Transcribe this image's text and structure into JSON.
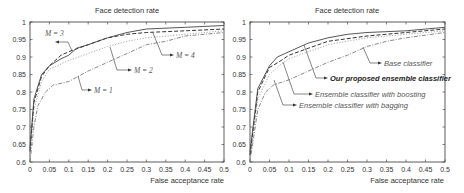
{
  "chart_data": [
    {
      "type": "line",
      "title": "Face detection rate",
      "xlabel": "False acceptance rate",
      "ylabel": "",
      "xlim": [
        0,
        0.5
      ],
      "ylim": [
        0.6,
        1.0
      ],
      "xticks": [
        "0",
        "0.05",
        "0.1",
        "0.15",
        "0.2",
        "0.25",
        "0.3",
        "0.35",
        "0.4",
        "0.45",
        "0.5"
      ],
      "yticks": [
        "0.6",
        "0.65",
        "0.7",
        "0.75",
        "0.8",
        "0.85",
        "0.9",
        "0.95",
        "1"
      ],
      "grid": false,
      "series": [
        {
          "name": "M = 1",
          "style": "dash-dot",
          "color": "#888888",
          "x": [
            0,
            0.01,
            0.02,
            0.04,
            0.06,
            0.1,
            0.15,
            0.2,
            0.25,
            0.3,
            0.35,
            0.4,
            0.45,
            0.5
          ],
          "y": [
            0.6,
            0.7,
            0.76,
            0.8,
            0.82,
            0.83,
            0.86,
            0.885,
            0.91,
            0.935,
            0.945,
            0.96,
            0.965,
            0.97
          ]
        },
        {
          "name": "M = 2",
          "style": "dotted",
          "color": "#aaaaaa",
          "x": [
            0,
            0.01,
            0.03,
            0.05,
            0.1,
            0.15,
            0.2,
            0.25,
            0.3,
            0.4,
            0.5
          ],
          "y": [
            0.62,
            0.75,
            0.83,
            0.865,
            0.89,
            0.91,
            0.93,
            0.945,
            0.955,
            0.965,
            0.975
          ]
        },
        {
          "name": "M = 3",
          "style": "dashed",
          "color": "#333333",
          "x": [
            0,
            0.01,
            0.03,
            0.05,
            0.08,
            0.1,
            0.15,
            0.2,
            0.25,
            0.3,
            0.4,
            0.5
          ],
          "y": [
            0.63,
            0.77,
            0.845,
            0.875,
            0.905,
            0.915,
            0.935,
            0.955,
            0.965,
            0.97,
            0.975,
            0.98
          ]
        },
        {
          "name": "M = 4",
          "style": "solid",
          "color": "#444444",
          "x": [
            0,
            0.01,
            0.03,
            0.05,
            0.08,
            0.1,
            0.12,
            0.15,
            0.2,
            0.25,
            0.3,
            0.4,
            0.5
          ],
          "y": [
            0.64,
            0.78,
            0.85,
            0.875,
            0.895,
            0.905,
            0.925,
            0.935,
            0.955,
            0.97,
            0.98,
            0.985,
            0.99
          ]
        }
      ],
      "annotations": [
        "M = 3",
        "M = 2",
        "M = 4",
        "M = 1"
      ]
    },
    {
      "type": "line",
      "title": "Face detection rate",
      "xlabel": "False acceptance rate",
      "ylabel": "",
      "xlim": [
        0,
        0.5
      ],
      "ylim": [
        0.6,
        1.0
      ],
      "xticks": [
        "0",
        "0.05",
        "0.1",
        "0.15",
        "0.2",
        "0.25",
        "0.3",
        "0.35",
        "0.4",
        "0.45",
        "0.5"
      ],
      "yticks": [
        "0.6",
        "0.65",
        "0.7",
        "0.75",
        "0.8",
        "0.85",
        "0.9",
        "0.95",
        "1"
      ],
      "grid": false,
      "series": [
        {
          "name": "Base classifier",
          "style": "dash-dot",
          "color": "#888888",
          "x": [
            0,
            0.02,
            0.04,
            0.06,
            0.1,
            0.15,
            0.2,
            0.25,
            0.3,
            0.35,
            0.4,
            0.5
          ],
          "y": [
            0.6,
            0.75,
            0.8,
            0.82,
            0.835,
            0.86,
            0.885,
            0.905,
            0.93,
            0.945,
            0.955,
            0.97
          ]
        },
        {
          "name": "Ensemble classifier with bagging",
          "style": "dotted",
          "color": "#aaaaaa",
          "x": [
            0,
            0.02,
            0.05,
            0.08,
            0.1,
            0.15,
            0.2,
            0.3,
            0.4,
            0.5
          ],
          "y": [
            0.61,
            0.78,
            0.85,
            0.88,
            0.895,
            0.915,
            0.935,
            0.955,
            0.965,
            0.975
          ]
        },
        {
          "name": "Ensemble classifier with boosting",
          "style": "dashed",
          "color": "#333333",
          "x": [
            0,
            0.02,
            0.05,
            0.08,
            0.1,
            0.15,
            0.2,
            0.3,
            0.4,
            0.5
          ],
          "y": [
            0.62,
            0.8,
            0.87,
            0.89,
            0.905,
            0.925,
            0.945,
            0.96,
            0.97,
            0.98
          ]
        },
        {
          "name": "Our proposed ensemble classifier",
          "style": "solid",
          "color": "#444444",
          "x": [
            0,
            0.02,
            0.05,
            0.07,
            0.1,
            0.15,
            0.2,
            0.25,
            0.3,
            0.4,
            0.5
          ],
          "y": [
            0.63,
            0.81,
            0.875,
            0.9,
            0.915,
            0.94,
            0.955,
            0.965,
            0.97,
            0.975,
            0.985
          ]
        }
      ],
      "annotations": [
        "Base classifier",
        "Our proposed ensemble classifier",
        "Ensemble classifier with boosting",
        "Ensemble classifier with bagging"
      ]
    }
  ],
  "left": {
    "title": "Face detection rate",
    "xlabel": "False acceptance rate",
    "labels": {
      "m3": "M = 3",
      "m2": "M = 2",
      "m4": "M = 4",
      "m1": "M = 1"
    }
  },
  "right": {
    "title": "Face detection rate",
    "xlabel": "False acceptance rate",
    "labels": {
      "base": "Base classifier",
      "proposed": "Our proposed ensemble classifier",
      "boosting": "Ensemble classifier with boosting",
      "bagging": "Ensemble classifier with bagging"
    }
  }
}
